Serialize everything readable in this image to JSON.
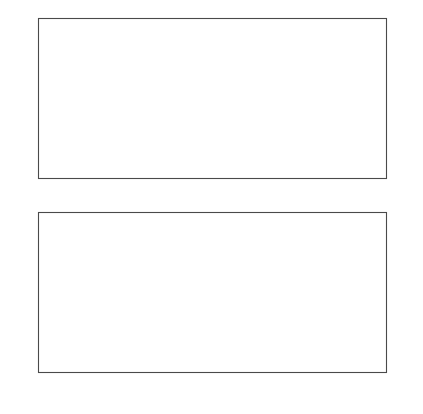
{
  "figure": {
    "background": "#ffffff",
    "ink": "#000000"
  },
  "chart_data": [
    {
      "id": "top",
      "type": "line",
      "title": "Ratio of Net Business Capital to Potential GDP",
      "title_superscript": "1",
      "xlabel": "",
      "ylabel": "",
      "xlim": [
        1985,
        1998
      ],
      "ylim": [
        1.0,
        1.4
      ],
      "ytick_labels": [
        "1.0",
        "1.1",
        "1.2",
        "1.3",
        "1.4"
      ],
      "ytick_values": [
        1.0,
        1.1,
        1.2,
        1.3,
        1.4
      ],
      "xtick_values": [
        1985,
        1986,
        1987,
        1988,
        1989,
        1990,
        1991,
        1992,
        1993,
        1994,
        1995,
        1996,
        1997,
        1998
      ],
      "xtick_labels": [
        "1985",
        "",
        "87",
        "",
        "89",
        "",
        "91",
        "",
        "93",
        "",
        "95",
        "",
        "97",
        ""
      ],
      "grid": false,
      "legend_position": "inline-annotation",
      "x": [
        1985,
        1986,
        1987,
        1988,
        1989,
        1990,
        1991,
        1992,
        1993,
        1994,
        1995,
        1996,
        1997,
        1998
      ],
      "series": [
        {
          "name": "Actual",
          "style": "dotted",
          "label": "Actual",
          "label_x": 1991.0,
          "label_y": 1.292,
          "values": [
            1.0,
            1.022,
            1.047,
            1.075,
            1.11,
            1.152,
            1.205,
            1.25,
            1.268,
            1.272,
            1.276,
            1.29,
            1.305,
            1.31
          ]
        },
        {
          "name": "Trend, 1975-86",
          "style": "solid",
          "label": "Trend, 1975–86",
          "label_x": 1992.6,
          "label_y": 1.152,
          "values": [
            1.0,
            1.0223,
            1.0446,
            1.0669,
            1.0892,
            1.1115,
            1.1338,
            1.1561,
            1.1784,
            1.2007,
            1.223,
            1.2453,
            1.2676,
            1.29
          ]
        }
      ]
    },
    {
      "id": "bottom",
      "type": "line",
      "title": "Efficiency of Investment",
      "subtitle": "(percent of GDP)",
      "xlabel": "",
      "ylabel": "",
      "xlim": [
        1985,
        1998
      ],
      "ylim": [
        25,
        35
      ],
      "ytick_labels": [
        "25",
        "27",
        "29",
        "31",
        "33",
        "35"
      ],
      "ytick_values": [
        25,
        27,
        29,
        31,
        33,
        35
      ],
      "xtick_values": [
        1985,
        1986,
        1987,
        1988,
        1989,
        1990,
        1991,
        1992,
        1993,
        1994,
        1995,
        1996,
        1997,
        1998
      ],
      "xtick_labels": [
        "1985",
        "",
        "87",
        "",
        "89",
        "",
        "91",
        "",
        "93",
        "",
        "95",
        "",
        "97",
        ""
      ],
      "grid": false,
      "legend_position": "inline-annotation",
      "x": [
        1985,
        1986,
        1987,
        1988,
        1989,
        1990,
        1991,
        1992,
        1993,
        1994,
        1995,
        1996,
        1997,
        1998
      ],
      "series": [
        {
          "name": "Capital income",
          "style": "solid",
          "label": "Capital income",
          "label_x": 1989.6,
          "label_y": 33.35,
          "values": [
            31.7,
            32.5,
            32.5,
            33.6,
            34.0,
            34.15,
            34.15,
            33.8,
            33.4,
            32.4,
            31.9,
            33.2,
            32.0,
            31.8
          ]
        },
        {
          "name": "Total investment",
          "style": "dotted",
          "label": "Total investment",
          "label_x": 1988.3,
          "label_y": 28.95,
          "values": [
            27.4,
            27.2,
            28.0,
            29.2,
            30.2,
            31.7,
            31.5,
            30.6,
            29.6,
            28.75,
            28.5,
            29.6,
            28.4,
            26.2
          ]
        }
      ]
    }
  ]
}
